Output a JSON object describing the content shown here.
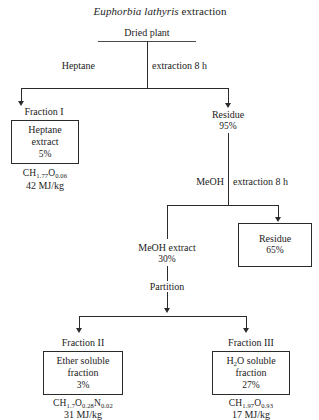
{
  "diagram": {
    "title_italic": "Euphorbia lathyris",
    "title_rest": " extraction",
    "root": {
      "label": "Dried plant"
    },
    "steps": {
      "heptane_left": "Heptane",
      "heptane_right": "extraction 8 h",
      "meoh_left": "MeOH",
      "meoh_right": "extraction 8 h",
      "partition": "Partition"
    },
    "nodes": {
      "fraction_1_caption": "Fraction I",
      "fraction_1_box_line1": "Heptane",
      "fraction_1_box_line2": "extract",
      "fraction_1_box_pct": "5%",
      "fraction_1_formula_base": "CH",
      "fraction_1_formula_sub1": "1.77",
      "fraction_1_formula_el2": "O",
      "fraction_1_formula_sub2": "0.06",
      "fraction_1_energy": "42 MJ/kg",
      "residue_95_label": "Residue",
      "residue_95_pct": "95%",
      "meoh_extract_label": "MeOH extract",
      "meoh_extract_pct": "30%",
      "residue_65_label": "Residue",
      "residue_65_pct": "65%",
      "fraction_2_caption": "Fraction II",
      "fraction_2_box_line1": "Ether soluble",
      "fraction_2_box_line2": "fraction",
      "fraction_2_box_pct": "3%",
      "fraction_2_formula_base": "CH",
      "fraction_2_formula_sub1": "1.7",
      "fraction_2_formula_el2": "O",
      "fraction_2_formula_sub2": "0.28",
      "fraction_2_formula_el3": "N",
      "fraction_2_formula_sub3": "0.02",
      "fraction_2_energy": "31 MJ/kg",
      "fraction_3_caption": "Fraction III",
      "fraction_3_box_line1_a": "H",
      "fraction_3_box_line1_sub": "2",
      "fraction_3_box_line1_b": "O soluble",
      "fraction_3_box_line2": "fraction",
      "fraction_3_box_pct": "27%",
      "fraction_3_formula_base": "CH",
      "fraction_3_formula_sub1": "1.97",
      "fraction_3_formula_el2": "O",
      "fraction_3_formula_sub2": "0.93",
      "fraction_3_energy": "17 MJ/kg"
    },
    "colors": {
      "line": "#2b2b2b",
      "text": "#1c1c1c",
      "background": "#ffffff"
    }
  }
}
